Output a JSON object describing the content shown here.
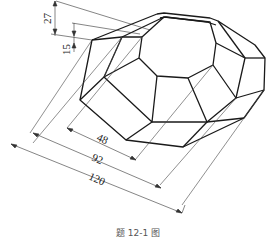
{
  "figure": {
    "type": "isometric technical drawing",
    "caption": "题 12-1 图"
  },
  "dimensions": [
    {
      "name": "total-height",
      "value": "27",
      "orientation": "vertical"
    },
    {
      "name": "upper-height",
      "value": "15",
      "orientation": "vertical"
    },
    {
      "name": "top-width",
      "value": "48",
      "orientation": "oblique"
    },
    {
      "name": "middle-width",
      "value": "92",
      "orientation": "oblique"
    },
    {
      "name": "base-width",
      "value": "120",
      "orientation": "oblique"
    }
  ],
  "colors": {
    "line": "#1a1a1a",
    "thin": "#333333",
    "background": "#ffffff"
  }
}
